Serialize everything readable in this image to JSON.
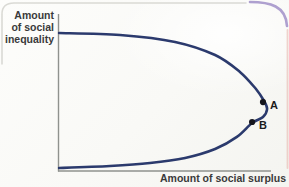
{
  "figure": {
    "y_axis_label": "Amount\nof social\ninequality",
    "x_axis_label": "Amount of social surplus"
  },
  "colors": {
    "curve": "#2b3a6d",
    "axis": "#8f928e",
    "point_marker": "#15151d",
    "label_text": "#3a3a3a",
    "card_border": "#d6d6d0",
    "page_corner_purple": "#a08fc8",
    "page_edge_pink": "#e6b3a8"
  },
  "chart_data": {
    "type": "line",
    "title": "",
    "xlabel": "Amount of social surplus",
    "ylabel": "Amount of social inequality",
    "x_axis": {
      "min": 0,
      "max": 1,
      "ticks": [],
      "note": "conceptual axis, no numeric scale shown"
    },
    "y_axis": {
      "min": 0,
      "max": 1,
      "ticks": [],
      "note": "conceptual axis, no numeric scale shown"
    },
    "grid": false,
    "legend": null,
    "series": [
      {
        "name": "inequality-vs-surplus-curve",
        "color": "#2b3a6d",
        "points_normalized": [
          [
            0.005,
            0.879
          ],
          [
            0.29,
            0.866
          ],
          [
            0.547,
            0.822
          ],
          [
            0.734,
            0.739
          ],
          [
            0.85,
            0.631
          ],
          [
            0.925,
            0.522
          ],
          [
            0.963,
            0.446
          ],
          [
            0.977,
            0.395
          ],
          [
            0.958,
            0.344
          ],
          [
            0.907,
            0.306
          ],
          [
            0.836,
            0.217
          ],
          [
            0.734,
            0.14
          ],
          [
            0.594,
            0.083
          ],
          [
            0.43,
            0.051
          ],
          [
            0.243,
            0.032
          ],
          [
            0.005,
            0.019
          ]
        ]
      }
    ],
    "annotations": [
      {
        "label": "A",
        "x": 0.958,
        "y": 0.439
      },
      {
        "label": "B",
        "x": 0.907,
        "y": 0.312
      }
    ]
  }
}
